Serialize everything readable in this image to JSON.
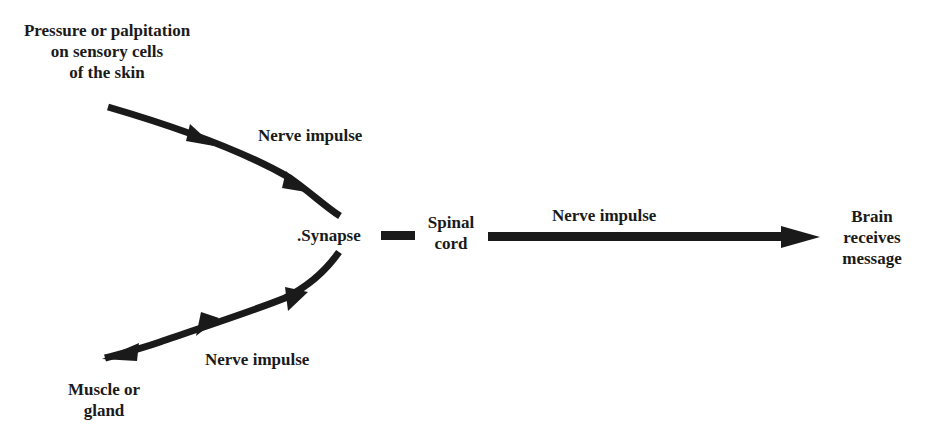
{
  "diagram": {
    "type": "flow",
    "title": "",
    "nodes": {
      "stimulus": {
        "lines": [
          "Pressure or palpitation",
          "on sensory cells",
          "of the skin"
        ]
      },
      "synapse": {
        "label": ".Synapse"
      },
      "spinal_cord": {
        "lines": [
          "Spinal",
          "cord"
        ]
      },
      "brain": {
        "lines": [
          "Brain",
          "receives",
          "message"
        ]
      },
      "effector": {
        "lines": [
          "Muscle or",
          "gland"
        ]
      }
    },
    "edges": {
      "afferent": {
        "label": "Nerve impulse",
        "from": "stimulus",
        "to": "synapse"
      },
      "ascending": {
        "label": "Nerve impulse",
        "from": "spinal_cord",
        "to": "brain"
      },
      "efferent": {
        "label": "Nerve impulse",
        "from": "synapse",
        "to": "effector"
      }
    },
    "colors": {
      "arrow": "#1a1a1a",
      "text": "#1a1a1a",
      "background": "#ffffff"
    }
  }
}
